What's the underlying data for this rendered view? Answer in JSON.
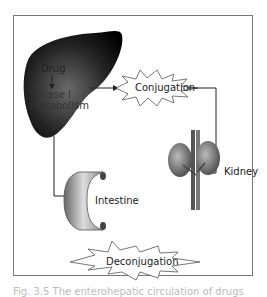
{
  "diagram": {
    "nodes": {
      "liver": {
        "drug": "Drug",
        "phase": "Phase I",
        "metab": "metabolism"
      },
      "conjugation": "Conjugation",
      "kidney": "Kidney",
      "intestine": "Intestine",
      "deconjugation": "Deconjugation"
    },
    "caption": "Fig. 3.5 The enterohepatic circulation of drugs"
  }
}
